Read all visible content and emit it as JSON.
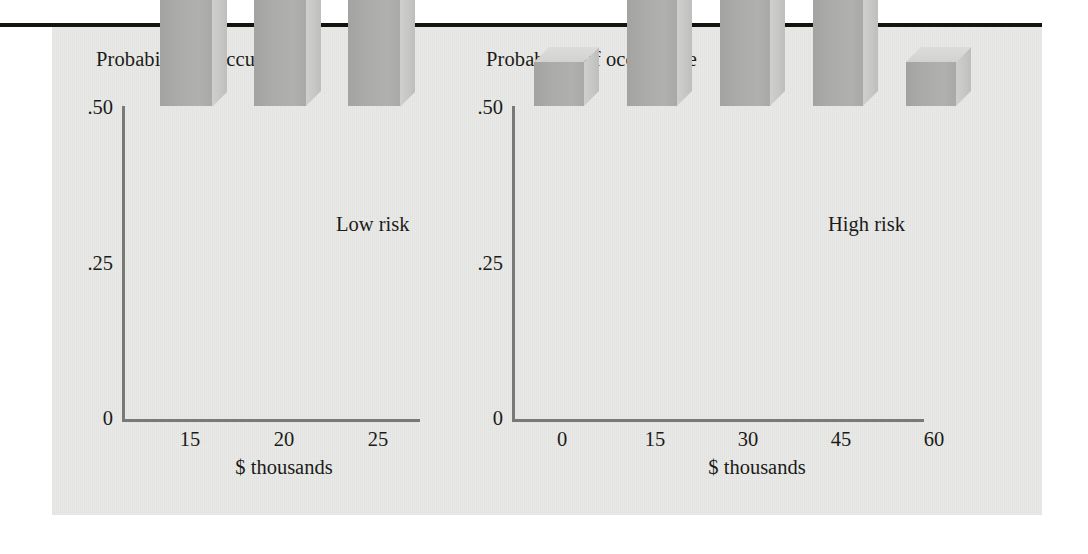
{
  "figure": {
    "background_color": "#e9eae8",
    "rule_color": "#14140f",
    "bar_front_color": "#abacaa",
    "bar_side_color": "#c6c7c4",
    "bar_top_color": "#d5d6d3",
    "axis_color": "#797a77",
    "text_color": "#1b1b18"
  },
  "chart_data": [
    {
      "type": "bar",
      "title": "Probability of occurrence",
      "xlabel": "$ thousands",
      "ylabel": "",
      "categories": [
        "15",
        "20",
        "25"
      ],
      "values": [
        0.25,
        0.48,
        0.25
      ],
      "ylim": [
        0,
        0.5
      ],
      "ytick_labels": [
        ".50",
        ".25",
        "0"
      ],
      "ytick_values": [
        0.5,
        0.25,
        0
      ],
      "grid": false,
      "legend_position": "inside-right",
      "annotations": [
        "Low risk"
      ],
      "series_label": "Low risk"
    },
    {
      "type": "bar",
      "title": "Probability of occurrence",
      "xlabel": "$ thousands",
      "ylabel": "",
      "categories": [
        "0",
        "15",
        "30",
        "45",
        "60"
      ],
      "values": [
        0.07,
        0.18,
        0.27,
        0.18,
        0.07
      ],
      "ylim": [
        0,
        0.5
      ],
      "ytick_labels": [
        ".50",
        ".25",
        "0"
      ],
      "ytick_values": [
        0.5,
        0.25,
        0
      ],
      "grid": false,
      "legend_position": "inside-right",
      "annotations": [
        "High risk"
      ],
      "series_label": "High risk"
    }
  ]
}
